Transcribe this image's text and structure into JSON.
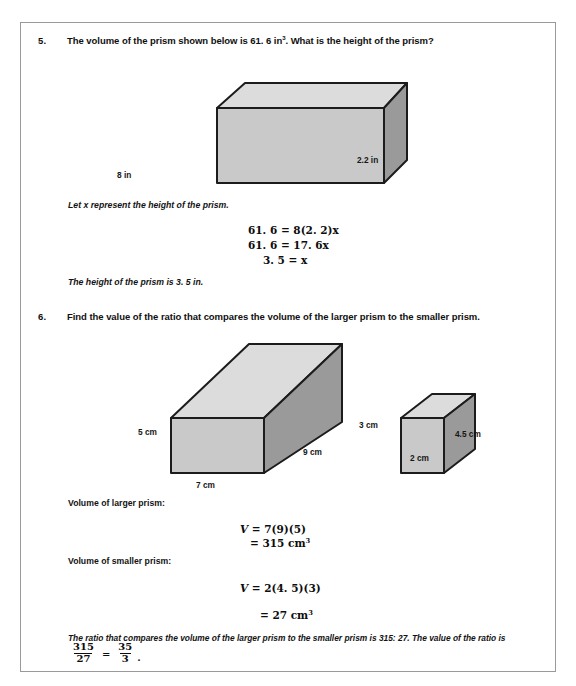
{
  "page": {
    "background_color": "#ffffff",
    "border_color": "#9a9a9a"
  },
  "figure_colors": {
    "front_face": "#c9c9c9",
    "top_face": "#dcdcdc",
    "side_face": "#9a9a9a",
    "outline": "#1c1c1c"
  },
  "problems": [
    {
      "number": "5.",
      "prompt_part1": "The volume of the prism shown below is 61. 6 in",
      "prompt_sup": "3",
      "prompt_part2": ".  What is the height of the prism?",
      "figure": {
        "name": "rectangular-prism-question-5",
        "labels": {
          "bottom": "8 in",
          "depth": "2.2 in"
        }
      },
      "work": {
        "intro": "Let x represent the height of the prism.",
        "equations": [
          "61. 6 = 8(2. 2)x",
          "61. 6 = 17. 6x",
          "3. 5 = x"
        ],
        "conclusion": "The height of the prism is 3. 5 in."
      }
    },
    {
      "number": "6.",
      "prompt": "Find the value of the ratio that compares the volume of the larger prism to the smaller prism.",
      "figures": [
        {
          "name": "larger-prism-question-6",
          "labels": {
            "height": "5 cm",
            "width": "7 cm",
            "depth": "9 cm"
          }
        },
        {
          "name": "smaller-prism-question-6",
          "labels": {
            "height": "3 cm",
            "width": "2 cm",
            "depth": "4.5 cm"
          }
        }
      ],
      "work": {
        "larger_label": "Volume of larger prism:",
        "larger_eq_line1": "V = 7(9)(5)",
        "larger_eq_line2": "= 315 cm",
        "larger_eq_line2_sup": "3",
        "smaller_label": "Volume of smaller prism:",
        "smaller_eq_line1": "V = 2(4. 5)(3)",
        "smaller_eq_line2": "= 27 cm",
        "smaller_eq_line2_sup": "3",
        "conclusion_line1": "The ratio that compares the volume of the larger prism to the smaller prism is 315: 27.  The value of the ratio is",
        "ratio_fraction": {
          "left_numerator": "315",
          "left_denominator": "27",
          "equals": "=",
          "right_numerator": "35",
          "right_denominator": "3",
          "trailing": "."
        }
      }
    }
  ]
}
